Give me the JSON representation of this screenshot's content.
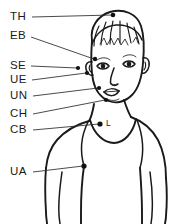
{
  "diagram": {
    "style": "black ink line art on white background",
    "colors": {
      "ink": "#1a1a1a",
      "leader_line": "#2a2a2a",
      "marker_dot": "#111111",
      "background": "#ffffff"
    },
    "labels": [
      {
        "id": "TH",
        "text": "TH",
        "meaning": "top of head",
        "label_x": 10,
        "label_y": 17,
        "leader_start_x": 32,
        "leader_start_y": 17,
        "leader_end_x": 112,
        "leader_end_y": 15,
        "marker_x": 113,
        "marker_y": 15,
        "marker_r": 2.3
      },
      {
        "id": "EB",
        "text": "EB",
        "meaning": "eyebrow",
        "label_x": 10,
        "label_y": 36,
        "leader_start_x": 31,
        "leader_start_y": 37,
        "leader_end_x": 94,
        "leader_end_y": 59,
        "marker_x": 95,
        "marker_y": 59,
        "marker_r": 2.2
      },
      {
        "id": "SE",
        "text": "SE",
        "meaning": "side of eye",
        "label_x": 10,
        "label_y": 66,
        "leader_start_x": 31,
        "leader_start_y": 66,
        "leader_end_x": 77,
        "leader_end_y": 68,
        "marker_x": 78,
        "marker_y": 68,
        "marker_r": 2.1
      },
      {
        "id": "UE",
        "text": "UE",
        "meaning": "under eye",
        "label_x": 10,
        "label_y": 80,
        "leader_start_x": 32,
        "leader_start_y": 80,
        "leader_end_x": 86,
        "leader_end_y": 73,
        "marker_x": 87,
        "marker_y": 73,
        "marker_r": 2.1
      },
      {
        "id": "UN",
        "text": "UN",
        "meaning": "under nose",
        "label_x": 10,
        "label_y": 96,
        "leader_start_x": 33,
        "leader_start_y": 96,
        "leader_end_x": 98,
        "leader_end_y": 88,
        "marker_x": 99,
        "marker_y": 88,
        "marker_r": 2.1
      },
      {
        "id": "CH",
        "text": "CH",
        "meaning": "chin",
        "label_x": 10,
        "label_y": 114,
        "leader_start_x": 33,
        "leader_start_y": 114,
        "leader_end_x": 105,
        "leader_end_y": 100,
        "marker_x": 106,
        "marker_y": 100,
        "marker_r": 2.1
      },
      {
        "id": "CB",
        "text": "CB",
        "meaning": "collarbone",
        "label_x": 10,
        "label_y": 130,
        "leader_start_x": 33,
        "leader_start_y": 130,
        "leader_end_x": 99,
        "leader_end_y": 124,
        "marker_x": 100,
        "marker_y": 124,
        "marker_r": 2.6
      },
      {
        "id": "UA",
        "text": "UA",
        "meaning": "underarm",
        "label_x": 10,
        "label_y": 172,
        "leader_start_x": 33,
        "leader_start_y": 172,
        "leader_end_x": 83,
        "leader_end_y": 166,
        "marker_x": 84,
        "marker_y": 166,
        "marker_r": 2.6
      }
    ],
    "inline_labels": [
      {
        "id": "L",
        "text": "L",
        "meaning": "chest landmark point",
        "label_x": 106,
        "label_y": 124,
        "marker_x": 99,
        "marker_y": 124,
        "marker_r": 2.6
      }
    ]
  }
}
